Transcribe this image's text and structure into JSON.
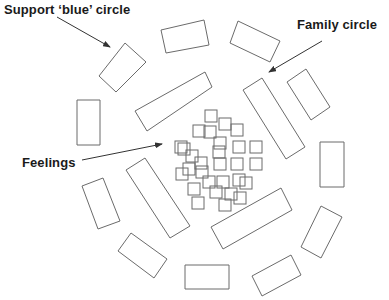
{
  "labels": {
    "support": "Support ‘blue’ circle",
    "family": "Family circle",
    "feelings": "Feelings"
  },
  "colors": {
    "stroke": "#6b6b6b",
    "text": "#1a1a1a",
    "background": "#ffffff"
  },
  "outer_rects": [
    {
      "id": "support-rect",
      "points": "99,76 125,43 146,62 116,92"
    },
    {
      "id": "top-rect",
      "points": "161,30 204,20 209,45 166,53"
    },
    {
      "id": "top-right-rect",
      "points": "238,21 280,41 270,62 230,43"
    },
    {
      "id": "long-left-rect",
      "points": "135,111 205,72 212,87 147,131"
    },
    {
      "id": "left-vertical-rect",
      "points": "77,100 100,100 100,145 77,145"
    },
    {
      "id": "family-long-rect",
      "points": "243,90 262,78 305,147 286,159"
    },
    {
      "id": "right-tilt-rect",
      "points": "287,82 306,69 330,107 311,120"
    },
    {
      "id": "right-vertical-rect",
      "points": "320,142 344,142 344,187 320,187"
    },
    {
      "id": "lower-right-rect",
      "points": "321,206 342,217 321,258 301,247"
    },
    {
      "id": "bottom-right-rect",
      "points": "252,276 291,255 301,275 262,296"
    },
    {
      "id": "long-bottom-rect",
      "points": "211,227 281,188 292,210 223,249"
    },
    {
      "id": "bottom-rect",
      "points": "185,265 229,265 229,289 185,289"
    },
    {
      "id": "bottom-left-tilt-rect",
      "points": "118,251 131,233 167,259 154,278"
    },
    {
      "id": "long-lower-left-rect",
      "points": "126,170 145,158 190,226 170,238"
    },
    {
      "id": "left-lower-rect",
      "points": "82,186 103,178 120,221 98,229"
    }
  ],
  "feeling_squares": [
    [
      205,
      110
    ],
    [
      193,
      125
    ],
    [
      219,
      118
    ],
    [
      231,
      124
    ],
    [
      175,
      141
    ],
    [
      204,
      126
    ],
    [
      214,
      137
    ],
    [
      233,
      141
    ],
    [
      250,
      141
    ],
    [
      186,
      150
    ],
    [
      178,
      143
    ],
    [
      213,
      146
    ],
    [
      195,
      157
    ],
    [
      214,
      158
    ],
    [
      231,
      158
    ],
    [
      250,
      158
    ],
    [
      183,
      163
    ],
    [
      176,
      168
    ],
    [
      196,
      166
    ],
    [
      233,
      174
    ],
    [
      188,
      183
    ],
    [
      217,
      176
    ],
    [
      210,
      186
    ],
    [
      192,
      197
    ],
    [
      225,
      188
    ],
    [
      240,
      177
    ],
    [
      203,
      176
    ],
    [
      219,
      199
    ],
    [
      234,
      192
    ]
  ],
  "arrows": [
    {
      "id": "support-arrow",
      "x1": 57,
      "y1": 17,
      "x2": 110,
      "y2": 47
    },
    {
      "id": "family-arrow",
      "x1": 322,
      "y1": 41,
      "x2": 269,
      "y2": 72
    },
    {
      "id": "feelings-arrow",
      "x1": 82,
      "y1": 160,
      "x2": 162,
      "y2": 144
    }
  ]
}
